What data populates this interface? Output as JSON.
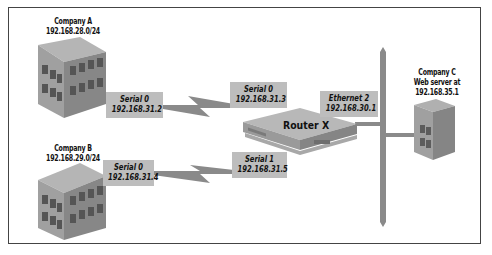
{
  "diagram": {
    "colors": {
      "label_bg": "#bdbdbd",
      "line": "#8a8a8a",
      "building_top": "#b8b8b8",
      "building_front": "#9a9a9a",
      "building_side": "#7e7e7e",
      "window": "#5a5a5a",
      "frame": "#444444"
    },
    "nodes": {
      "company_a": {
        "name": "Company A",
        "network": "192.168.28.0/24"
      },
      "company_b": {
        "name": "Company B",
        "network": "192.168.29.0/24"
      },
      "company_c": {
        "name": "Company C",
        "desc": "Web server at",
        "address": "192.168.35.1"
      },
      "router": {
        "name": "Router X"
      }
    },
    "interfaces": {
      "a_serial": {
        "name": "Serial 0",
        "ip": "192.168.31.2"
      },
      "router_serial0": {
        "name": "Serial 0",
        "ip": "192.168.31.3"
      },
      "b_serial": {
        "name": "Serial 0",
        "ip": "192.168.31.4"
      },
      "router_serial1": {
        "name": "Serial 1",
        "ip": "192.168.31.5"
      },
      "router_eth2": {
        "name": "Ethernet 2",
        "ip": "192.168.30.1"
      }
    }
  }
}
